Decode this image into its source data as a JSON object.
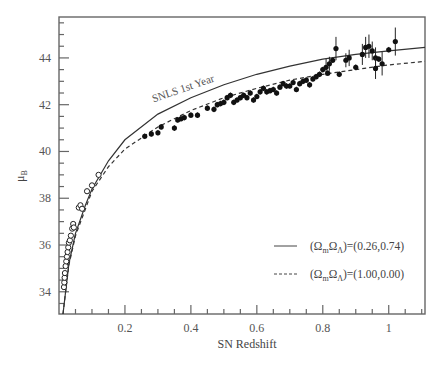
{
  "chart_data": {
    "type": "scatter",
    "title": "",
    "xlabel": "SN Redshift",
    "ylabel": "μ_B",
    "ylabel_main": "μ",
    "ylabel_sub": "B",
    "xlim": [
      0,
      1.11
    ],
    "ylim": [
      33.05,
      45.75
    ],
    "grid": false,
    "x_ticks": [
      0.2,
      0.4,
      0.6,
      0.8,
      1
    ],
    "x_tick_labels": [
      "0.2",
      "0.4",
      "0.6",
      "0.8",
      "1"
    ],
    "y_ticks": [
      34,
      36,
      38,
      40,
      42,
      44
    ],
    "y_tick_labels": [
      "34",
      "36",
      "38",
      "40",
      "42",
      "44"
    ],
    "annotation": {
      "text": "SNLS 1st Year",
      "x": 0.38,
      "y": 42.55,
      "rotation": -19
    },
    "legend": {
      "position": "lower right",
      "entries": [
        {
          "style": "solid",
          "label_prefix": "(Ω",
          "sub1": "m",
          "mid": "Ω",
          "sub2": "Λ",
          "label_suffix": ")=(0.26,0.74)"
        },
        {
          "style": "dashed",
          "label_prefix": "(Ω",
          "sub1": "m",
          "mid": "Ω",
          "sub2": "Λ",
          "label_suffix": ")=(1.00,0.00)"
        }
      ]
    },
    "series": [
      {
        "name": "(Ωm,ΩΛ)=(0.26,0.74)",
        "kind": "line",
        "style": "solid",
        "points": [
          [
            0.012,
            33.05
          ],
          [
            0.02,
            34.0
          ],
          [
            0.03,
            35.2
          ],
          [
            0.05,
            36.5
          ],
          [
            0.08,
            37.7
          ],
          [
            0.1,
            38.4
          ],
          [
            0.15,
            39.6
          ],
          [
            0.2,
            40.5
          ],
          [
            0.3,
            41.6
          ],
          [
            0.4,
            42.3
          ],
          [
            0.5,
            42.85
          ],
          [
            0.6,
            43.3
          ],
          [
            0.7,
            43.65
          ],
          [
            0.8,
            43.95
          ],
          [
            0.9,
            44.15
          ],
          [
            1.0,
            44.3
          ],
          [
            1.11,
            44.45
          ]
        ]
      },
      {
        "name": "(Ωm,ΩΛ)=(1.00,0.00)",
        "kind": "line",
        "style": "dashed",
        "points": [
          [
            0.012,
            33.05
          ],
          [
            0.02,
            34.0
          ],
          [
            0.03,
            35.15
          ],
          [
            0.05,
            36.4
          ],
          [
            0.1,
            38.3
          ],
          [
            0.15,
            39.35
          ],
          [
            0.2,
            40.1
          ],
          [
            0.3,
            41.05
          ],
          [
            0.4,
            41.75
          ],
          [
            0.5,
            42.3
          ],
          [
            0.6,
            42.7
          ],
          [
            0.7,
            43.05
          ],
          [
            0.8,
            43.3
          ],
          [
            0.9,
            43.5
          ],
          [
            1.0,
            43.7
          ],
          [
            1.11,
            43.85
          ]
        ]
      },
      {
        "name": "Low-z SNe",
        "kind": "scatter",
        "marker": "open-circle",
        "points": [
          [
            0.015,
            34.2
          ],
          [
            0.016,
            34.4
          ],
          [
            0.017,
            34.6
          ],
          [
            0.018,
            34.8
          ],
          [
            0.02,
            35.1
          ],
          [
            0.022,
            35.3
          ],
          [
            0.024,
            35.5
          ],
          [
            0.026,
            35.7
          ],
          [
            0.028,
            35.9
          ],
          [
            0.03,
            36.1
          ],
          [
            0.033,
            36.2
          ],
          [
            0.036,
            36.4
          ],
          [
            0.04,
            36.7
          ],
          [
            0.043,
            36.9
          ],
          [
            0.045,
            36.75
          ],
          [
            0.06,
            37.6
          ],
          [
            0.065,
            37.7
          ],
          [
            0.07,
            37.55
          ],
          [
            0.085,
            38.3
          ],
          [
            0.1,
            38.55
          ],
          [
            0.12,
            39.0
          ]
        ]
      },
      {
        "name": "SNLS 1st Year",
        "kind": "scatter",
        "marker": "filled-circle",
        "points": [
          [
            0.26,
            40.65
          ],
          [
            0.28,
            40.75
          ],
          [
            0.3,
            40.8
          ],
          [
            0.31,
            41.05
          ],
          [
            0.35,
            41.0
          ],
          [
            0.36,
            41.35
          ],
          [
            0.37,
            41.4
          ],
          [
            0.38,
            41.45
          ],
          [
            0.4,
            41.55
          ],
          [
            0.42,
            41.55
          ],
          [
            0.45,
            41.85
          ],
          [
            0.47,
            41.8
          ],
          [
            0.48,
            42.0
          ],
          [
            0.49,
            42.05
          ],
          [
            0.5,
            42.1
          ],
          [
            0.51,
            42.3
          ],
          [
            0.52,
            42.4
          ],
          [
            0.53,
            42.1
          ],
          [
            0.54,
            42.2
          ],
          [
            0.55,
            42.3
          ],
          [
            0.56,
            42.4
          ],
          [
            0.57,
            42.3
          ],
          [
            0.58,
            42.5
          ],
          [
            0.59,
            42.2
          ],
          [
            0.6,
            42.35
          ],
          [
            0.61,
            42.55
          ],
          [
            0.62,
            42.7
          ],
          [
            0.63,
            42.55
          ],
          [
            0.64,
            42.6
          ],
          [
            0.65,
            42.65
          ],
          [
            0.66,
            42.5
          ],
          [
            0.67,
            42.75
          ],
          [
            0.68,
            42.9
          ],
          [
            0.69,
            42.8
          ],
          [
            0.7,
            42.8
          ],
          [
            0.71,
            42.95
          ],
          [
            0.72,
            42.65
          ],
          [
            0.73,
            42.9
          ],
          [
            0.74,
            43.0
          ],
          [
            0.75,
            43.05
          ],
          [
            0.76,
            42.85
          ],
          [
            0.77,
            43.1
          ],
          [
            0.78,
            43.2
          ],
          [
            0.79,
            43.3
          ],
          [
            0.8,
            43.5
          ],
          [
            0.81,
            43.6
          ],
          [
            0.815,
            43.35
          ],
          [
            0.82,
            43.75
          ],
          [
            0.83,
            43.9
          ],
          [
            0.84,
            44.4
          ],
          [
            0.85,
            43.3
          ],
          [
            0.87,
            43.9
          ],
          [
            0.88,
            44.0
          ],
          [
            0.9,
            43.6
          ],
          [
            0.92,
            44.15
          ],
          [
            0.93,
            44.45
          ],
          [
            0.94,
            44.5
          ],
          [
            0.95,
            44.3
          ],
          [
            0.96,
            44.0
          ],
          [
            0.96,
            43.55
          ],
          [
            0.97,
            43.95
          ],
          [
            0.98,
            43.75
          ],
          [
            1.0,
            44.35
          ],
          [
            1.02,
            44.7
          ]
        ],
        "error_bars": {
          "0.84": 0.5,
          "0.88": 0.35,
          "0.92": 0.45,
          "0.93": 0.45,
          "0.94": 0.5,
          "0.95": 0.4,
          "0.96": 0.45,
          "0.98": 0.5,
          "1.0": 0.4,
          "1.02": 0.6,
          "0.87": 0.3,
          "0.81": 0.35,
          "0.82": 0.3
        }
      }
    ]
  },
  "layout": {
    "plot_left": 59,
    "plot_top": 17,
    "plot_right": 425,
    "plot_bottom": 314,
    "colors": {
      "axis": "#555555",
      "line": "#333333",
      "marker": "#111111",
      "text": "#555555"
    }
  }
}
